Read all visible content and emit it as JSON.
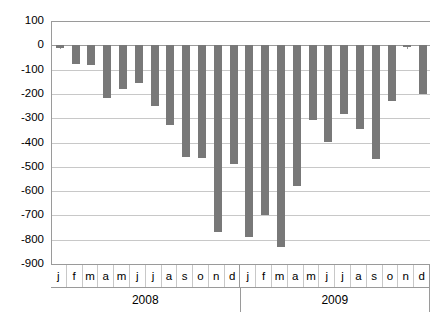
{
  "chart_data": {
    "type": "bar",
    "title": "",
    "subtitle": "",
    "xlabel": "",
    "ylabel": "",
    "ylim": [
      -900,
      100
    ],
    "grid": true,
    "legend": "none",
    "bar_color": "#787878",
    "y_ticks": [
      100,
      0,
      -100,
      -200,
      -300,
      -400,
      -500,
      -600,
      -700,
      -800,
      -900
    ],
    "y_tick_labels": [
      "100",
      "0",
      "-100",
      "-200",
      "-300",
      "-400",
      "-500",
      "-600",
      "-700",
      "-800",
      "-900"
    ],
    "group_labels": [
      "2008",
      "2009"
    ],
    "categories": [
      "j",
      "f",
      "m",
      "a",
      "m",
      "j",
      "j",
      "a",
      "s",
      "o",
      "n",
      "d",
      "j",
      "f",
      "m",
      "a",
      "m",
      "j",
      "j",
      "a",
      "s",
      "o",
      "n",
      "d"
    ],
    "values": [
      -12,
      -80,
      -82,
      -218,
      -180,
      -155,
      -250,
      -330,
      -460,
      -465,
      -770,
      -490,
      -790,
      -700,
      -830,
      -580,
      -310,
      -400,
      -285,
      -345,
      -470,
      -230,
      -10,
      -200
    ],
    "series": [
      {
        "name": "monthly value",
        "values": [
          -12,
          -80,
          -82,
          -218,
          -180,
          -155,
          -250,
          -330,
          -460,
          -465,
          -770,
          -490,
          -790,
          -700,
          -830,
          -580,
          -310,
          -400,
          -285,
          -345,
          -470,
          -230,
          -10,
          -200
        ]
      }
    ]
  }
}
